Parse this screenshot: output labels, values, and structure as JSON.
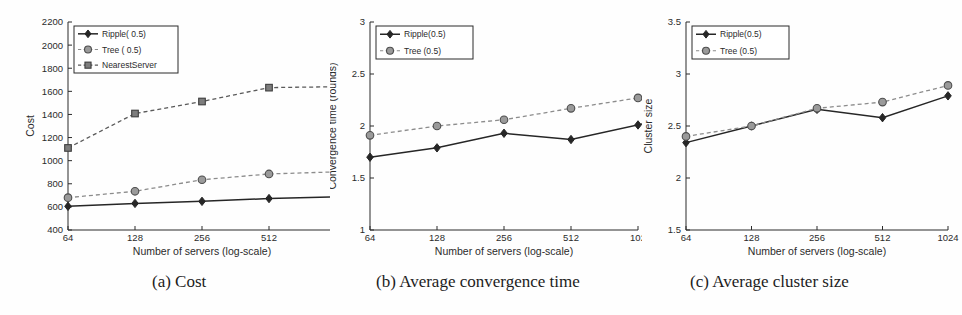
{
  "figure": {
    "background_color": "#fefefe",
    "ink_color": "#2b2b2b",
    "series_colors": {
      "ripple": "#262626",
      "tree": "#8c8c8c",
      "nearest_server": "#5a5a5a"
    },
    "captions": [
      {
        "id": "a",
        "text": "(a) Cost"
      },
      {
        "id": "b",
        "text": "(b) Average convergence time"
      },
      {
        "id": "c",
        "text": "(c) Average cluster size"
      }
    ]
  },
  "chart_data": [
    {
      "id": "a",
      "type": "line",
      "title": "",
      "xlabel": "Number of servers (log-scale)",
      "ylabel": "Cost",
      "x": [
        64,
        128,
        256,
        512,
        1024
      ],
      "xtick_labels": [
        "64",
        "128",
        "256",
        "512",
        "10"
      ],
      "xtick_labels_full": [
        "64",
        "128",
        "256",
        "512",
        "1024"
      ],
      "xscale": "log2",
      "ylim": [
        400,
        2200
      ],
      "yticks": [
        400,
        600,
        800,
        1000,
        1200,
        1400,
        1600,
        1800,
        2000,
        2200
      ],
      "ytick_labels": [
        "400",
        "600",
        "800",
        "1000",
        "1200",
        "1400",
        "1600",
        "1800",
        "2000",
        "2200"
      ],
      "grid": false,
      "clipped_right": true,
      "legend_position": "upper-left",
      "series": [
        {
          "name": "Ripple( 0.5)",
          "marker": "diamond",
          "linestyle": "solid",
          "color": "#262626",
          "values": [
            605,
            630,
            648,
            672,
            688
          ]
        },
        {
          "name": "Tree   ( 0.5)",
          "marker": "circle",
          "linestyle": "dashed",
          "color": "#8c8c8c",
          "values": [
            680,
            735,
            835,
            885,
            903
          ]
        },
        {
          "name": "NearestServer",
          "marker": "square",
          "linestyle": "dashed",
          "color": "#5a5a5a",
          "values": [
            1110,
            1408,
            1512,
            1632,
            1640
          ]
        }
      ]
    },
    {
      "id": "b",
      "type": "line",
      "title": "",
      "xlabel": "Number of servers (log-scale)",
      "ylabel": "Convergence time (rounds)",
      "x": [
        64,
        128,
        256,
        512,
        1024
      ],
      "xtick_labels": [
        "64",
        "128",
        "256",
        "512",
        "102"
      ],
      "xtick_labels_full": [
        "64",
        "128",
        "256",
        "512",
        "1024"
      ],
      "xscale": "log2",
      "ylim": [
        1,
        3
      ],
      "yticks": [
        1,
        1.5,
        2,
        2.5,
        3
      ],
      "ytick_labels": [
        "1",
        "1.5",
        "2",
        "2.5",
        "3"
      ],
      "grid": false,
      "clipped_right": true,
      "legend_position": "upper-left",
      "series": [
        {
          "name": "Ripple(0.5)",
          "marker": "diamond",
          "linestyle": "solid",
          "color": "#262626",
          "values": [
            1.7,
            1.79,
            1.93,
            1.87,
            2.01
          ]
        },
        {
          "name": "Tree   (0.5)",
          "marker": "circle",
          "linestyle": "dashed",
          "color": "#8c8c8c",
          "values": [
            1.91,
            2.0,
            2.06,
            2.17,
            2.27
          ]
        }
      ]
    },
    {
      "id": "c",
      "type": "line",
      "title": "",
      "xlabel": "Number of servers (log-scale)",
      "ylabel": "Cluster size",
      "x": [
        64,
        128,
        256,
        512,
        1024
      ],
      "xtick_labels": [
        "64",
        "128",
        "256",
        "512",
        "1024"
      ],
      "xtick_labels_full": [
        "64",
        "128",
        "256",
        "512",
        "1024"
      ],
      "xscale": "log2",
      "ylim": [
        1.5,
        3.5
      ],
      "yticks": [
        1.5,
        2,
        2.5,
        3,
        3.5
      ],
      "ytick_labels": [
        "1.5",
        "2",
        "2.5",
        "3",
        "3.5"
      ],
      "grid": false,
      "clipped_right": false,
      "legend_position": "upper-left",
      "series": [
        {
          "name": "Ripple(0.5)",
          "marker": "diamond",
          "linestyle": "solid",
          "color": "#262626",
          "values": [
            2.34,
            2.5,
            2.66,
            2.58,
            2.79
          ]
        },
        {
          "name": "Tree   (0.5)",
          "marker": "circle",
          "linestyle": "dashed",
          "color": "#8c8c8c",
          "values": [
            2.4,
            2.5,
            2.67,
            2.73,
            2.89
          ]
        }
      ]
    }
  ]
}
